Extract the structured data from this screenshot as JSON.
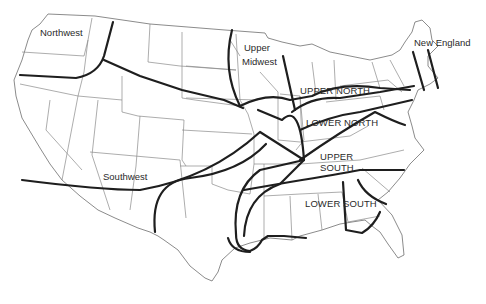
{
  "map": {
    "subject": "United States dialect regions",
    "colors": {
      "background": "#ffffff",
      "boundary_line": "#1e1e1e",
      "state_line": "#8a8a8a",
      "label_text": "#2a2a2a"
    },
    "regions": [
      {
        "id": "northwest",
        "label": "Northwest"
      },
      {
        "id": "upper-midwest",
        "label_line1": "Upper",
        "label_line2": "Midwest"
      },
      {
        "id": "new-england",
        "label": "New England"
      },
      {
        "id": "upper-north",
        "label": "UPPER NORTH"
      },
      {
        "id": "lower-north",
        "label": "LOWER NORTH"
      },
      {
        "id": "upper-south",
        "label_line1": "UPPER",
        "label_line2": "SOUTH"
      },
      {
        "id": "lower-south",
        "label": "LOWER SOUTH"
      },
      {
        "id": "southwest",
        "label": "Southwest"
      }
    ]
  }
}
